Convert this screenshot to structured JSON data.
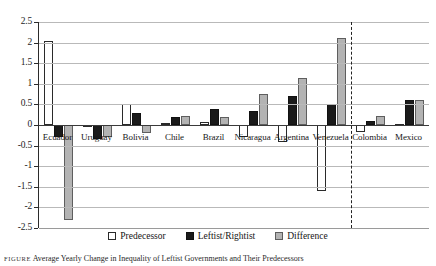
{
  "chart_data": {
    "type": "bar",
    "title": "",
    "xlabel": "",
    "ylabel": "",
    "ylim": [
      -2.5,
      2.5
    ],
    "yticks": [
      2.5,
      2,
      1.5,
      1,
      0.5,
      0,
      -0.5,
      -1,
      -1.5,
      -2,
      -2.5
    ],
    "ytick_labels": [
      "2.5",
      "2",
      "1.5",
      "1",
      "0.5",
      "0",
      "-0.5",
      "-1",
      "-1.5",
      "-2",
      "-2.5"
    ],
    "grid": true,
    "legend_position": "bottom",
    "categories": [
      "Ecuador",
      "Uruguay",
      "Bolivia",
      "Chile",
      "Brazil",
      "Nicaragua",
      "Argentina",
      "Venezuela",
      "Colombia",
      "Mexico"
    ],
    "series": [
      {
        "name": "Predecessor",
        "color": "#ffffff",
        "values": [
          2.05,
          -0.04,
          0.5,
          0.05,
          0.07,
          -0.3,
          -0.42,
          -1.6,
          -0.17,
          0.02
        ]
      },
      {
        "name": "Leftist/Rightist",
        "color": "#1a1a1a",
        "values": [
          -0.28,
          -0.33,
          0.3,
          0.2,
          0.38,
          0.35,
          0.7,
          0.5,
          0.1,
          0.6
        ]
      },
      {
        "name": "Difference",
        "color": "#b3b3b3",
        "values": [
          -2.3,
          -0.28,
          -0.2,
          0.22,
          0.2,
          0.75,
          1.15,
          2.1,
          0.22,
          0.6
        ]
      }
    ],
    "annotations": [
      {
        "type": "vertical-dashed-divider",
        "after_category": "Venezuela"
      }
    ]
  },
  "legend": {
    "items": [
      {
        "label": "Predecessor",
        "swatch": "predecessor-swatch"
      },
      {
        "label": "Leftist/Rightist",
        "swatch": "leftist-rightist-swatch"
      },
      {
        "label": "Difference",
        "swatch": "difference-swatch"
      }
    ]
  },
  "caption": {
    "tag": "FIGURE",
    "text": "Average Yearly Change in Inequality of Leftist Governments and Their Predecessors"
  }
}
